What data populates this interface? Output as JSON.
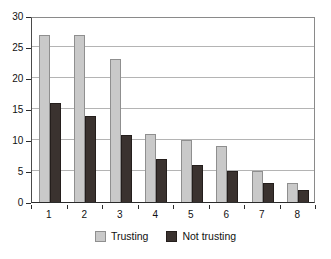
{
  "chart_data": {
    "type": "bar",
    "title": "",
    "subtitle": "",
    "xlabel": "",
    "ylabel": "",
    "categories": [
      "1",
      "2",
      "3",
      "4",
      "5",
      "6",
      "7",
      "8"
    ],
    "series": [
      {
        "name": "Trusting",
        "color": "#c9c9c9",
        "values": [
          27,
          27,
          23,
          11,
          10,
          9,
          5,
          3
        ]
      },
      {
        "name": "Not trusting",
        "color": "#3a322f",
        "values": [
          16,
          13.8,
          10.8,
          7,
          6,
          5,
          3,
          2
        ]
      }
    ],
    "ylim": [
      0,
      30
    ],
    "ytick_values": [
      0,
      5,
      10,
      15,
      20,
      25,
      30
    ],
    "ytick_labels": [
      "0",
      "5",
      "10",
      "15",
      "20",
      "25",
      "30"
    ],
    "grid": true,
    "grid_axis": "y",
    "legend_position": "bottom",
    "bar_gap": "grouped-adjacent"
  },
  "legend": {
    "items": [
      {
        "label": "Trusting",
        "swatch": "legend-swatch-trusting"
      },
      {
        "label": "Not trusting",
        "swatch": "legend-swatch-not-trusting"
      }
    ]
  }
}
